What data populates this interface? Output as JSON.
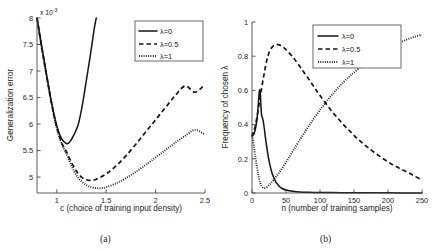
{
  "figure": {
    "caption_a": "(a)",
    "caption_b": "(b)"
  },
  "chart_data": [
    {
      "id": "panel-a",
      "type": "line",
      "title": "",
      "xlabel": "c (choice of training input density)",
      "ylabel": "Generalization error",
      "y_multiplier": "x 10",
      "y_multiplier_exp": "-3",
      "xlim": [
        0.8,
        2.5
      ],
      "ylim": [
        0.0047,
        0.008
      ],
      "xticks": [
        1,
        1.5,
        2,
        2.5
      ],
      "xticklabels": [
        "1",
        "1.5",
        "2",
        "2.5"
      ],
      "yticks": [
        0.005,
        0.0055,
        0.006,
        0.0065,
        0.007,
        0.0075,
        0.008
      ],
      "yticklabels": [
        "5",
        "5.5",
        "6",
        "6.5",
        "7",
        "7.5",
        "8"
      ],
      "grid": false,
      "legend_position": "top-right",
      "series": [
        {
          "name": "λ=0",
          "style": "solid",
          "x": [
            0.8,
            0.85,
            0.9,
            0.95,
            1.0,
            1.05,
            1.1,
            1.13,
            1.18,
            1.22,
            1.26,
            1.3,
            1.34,
            1.38,
            1.4
          ],
          "y": [
            0.008,
            0.00744,
            0.0069,
            0.00638,
            0.00597,
            0.00572,
            0.00563,
            0.00566,
            0.00582,
            0.00601,
            0.00637,
            0.00683,
            0.0073,
            0.00781,
            0.008
          ]
        },
        {
          "name": "λ=0.5",
          "style": "dashed",
          "x": [
            0.8,
            0.85,
            0.9,
            0.95,
            1.0,
            1.05,
            1.1,
            1.15,
            1.2,
            1.25,
            1.3,
            1.35,
            1.4,
            1.5,
            1.6,
            1.7,
            1.8,
            1.9,
            2.0,
            2.1,
            2.2,
            2.3,
            2.4,
            2.5
          ],
          "y": [
            0.008,
            0.00742,
            0.00688,
            0.00637,
            0.00594,
            0.00565,
            0.00547,
            0.00527,
            0.00511,
            0.005,
            0.00495,
            0.00494,
            0.00496,
            0.00506,
            0.00521,
            0.0054,
            0.00562,
            0.00585,
            0.00608,
            0.00631,
            0.00654,
            0.00672,
            0.0066,
            0.00675
          ]
        },
        {
          "name": "λ=1",
          "style": "dotted",
          "x": [
            0.8,
            0.85,
            0.9,
            0.95,
            1.0,
            1.05,
            1.1,
            1.15,
            1.2,
            1.25,
            1.3,
            1.35,
            1.4,
            1.45,
            1.5,
            1.6,
            1.7,
            1.8,
            1.9,
            2.0,
            2.1,
            2.2,
            2.3,
            2.4,
            2.5
          ],
          "y": [
            0.008,
            0.00741,
            0.00687,
            0.00635,
            0.00592,
            0.00562,
            0.00543,
            0.00521,
            0.00503,
            0.00492,
            0.00485,
            0.00481,
            0.00479,
            0.00479,
            0.00481,
            0.00488,
            0.00498,
            0.0051,
            0.00523,
            0.00537,
            0.00551,
            0.00565,
            0.00578,
            0.00589,
            0.0058
          ]
        }
      ]
    },
    {
      "id": "panel-b",
      "type": "line",
      "title": "",
      "xlabel": "n (number of training samples)",
      "ylabel": "Frequency of chosen λ",
      "xlim": [
        0,
        250
      ],
      "ylim": [
        0,
        1
      ],
      "xticks": [
        0,
        50,
        100,
        150,
        200,
        250
      ],
      "xticklabels": [
        "0",
        "50",
        "100",
        "150",
        "200",
        "250"
      ],
      "yticks": [
        0,
        0.2,
        0.4,
        0.6,
        0.8,
        1
      ],
      "yticklabels": [
        "0",
        "0.2",
        "0.4",
        "0.6",
        "0.8",
        "1"
      ],
      "grid": false,
      "legend_position": "top-right",
      "series": [
        {
          "name": "λ=0",
          "style": "solid",
          "x": [
            0,
            3,
            6,
            8,
            10,
            11,
            12,
            13,
            14,
            16,
            18,
            20,
            23,
            26,
            30,
            35,
            40,
            45,
            50,
            60,
            70,
            85,
            100,
            130,
            160,
            200,
            250
          ],
          "y": [
            0.335,
            0.345,
            0.395,
            0.455,
            0.56,
            0.6,
            0.595,
            0.52,
            0.46,
            0.43,
            0.38,
            0.315,
            0.235,
            0.17,
            0.11,
            0.065,
            0.04,
            0.025,
            0.018,
            0.01,
            0.006,
            0.004,
            0.003,
            0.002,
            0.001,
            0.001,
            0.0
          ]
        },
        {
          "name": "λ=0.5",
          "style": "dashed",
          "x": [
            0,
            5,
            10,
            14,
            18,
            22,
            26,
            30,
            35,
            40,
            45,
            50,
            60,
            70,
            80,
            90,
            100,
            115,
            130,
            145,
            160,
            175,
            190,
            205,
            220,
            235,
            250
          ],
          "y": [
            0.33,
            0.395,
            0.51,
            0.61,
            0.7,
            0.78,
            0.83,
            0.855,
            0.868,
            0.866,
            0.855,
            0.838,
            0.795,
            0.742,
            0.685,
            0.628,
            0.57,
            0.49,
            0.42,
            0.357,
            0.3,
            0.252,
            0.208,
            0.17,
            0.138,
            0.108,
            0.075
          ]
        },
        {
          "name": "λ=1",
          "style": "dotted",
          "x": [
            0,
            3,
            6,
            9,
            12,
            15,
            20,
            26,
            32,
            40,
            50,
            60,
            75,
            90,
            105,
            120,
            135,
            150,
            165,
            180,
            195,
            210,
            225,
            240,
            250
          ],
          "y": [
            0.35,
            0.265,
            0.185,
            0.115,
            0.06,
            0.035,
            0.03,
            0.05,
            0.078,
            0.12,
            0.18,
            0.245,
            0.34,
            0.43,
            0.512,
            0.585,
            0.65,
            0.705,
            0.755,
            0.8,
            0.838,
            0.868,
            0.893,
            0.915,
            0.925
          ]
        }
      ]
    }
  ]
}
